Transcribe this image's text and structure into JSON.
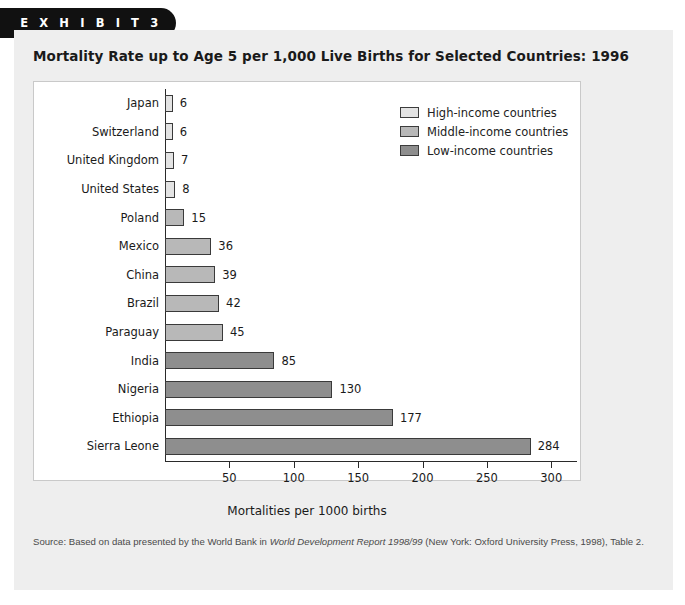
{
  "exhibit": {
    "badge_label": "E X H I B I T   3"
  },
  "title": "Mortality Rate up to Age 5 per 1,000 Live Births for Selected Countries: 1996",
  "legend": {
    "items": [
      {
        "label": "High-income countries",
        "color": "#e3e3e3"
      },
      {
        "label": "Middle-income countries",
        "color": "#b8b8b8"
      },
      {
        "label": "Low-income countries",
        "color": "#8e8e8e"
      }
    ]
  },
  "source": {
    "prefix": "Source: Based on data presented by the World Bank in ",
    "italic": "World Development Report 1998/99",
    "suffix": " (New York: Oxford University Press, 1998), Table 2."
  },
  "chart_data": {
    "type": "bar",
    "orientation": "horizontal",
    "title": "Mortality Rate up to Age 5 per 1,000 Live Births for Selected Countries: 1996",
    "xlabel": "Mortalities per 1000 births",
    "ylabel": "",
    "xlim": [
      0,
      320
    ],
    "xticks": [
      50,
      100,
      150,
      200,
      250,
      300
    ],
    "grid": false,
    "legend_position": "top-right",
    "categories": [
      "Japan",
      "Switzerland",
      "United Kingdom",
      "United States",
      "Poland",
      "Mexico",
      "China",
      "Brazil",
      "Paraguay",
      "India",
      "Nigeria",
      "Ethiopia",
      "Sierra Leone"
    ],
    "values": [
      6,
      6,
      7,
      8,
      15,
      36,
      39,
      42,
      45,
      85,
      130,
      177,
      284
    ],
    "groups": [
      "High-income countries",
      "High-income countries",
      "High-income countries",
      "High-income countries",
      "Middle-income countries",
      "Middle-income countries",
      "Middle-income countries",
      "Middle-income countries",
      "Middle-income countries",
      "Low-income countries",
      "Low-income countries",
      "Low-income countries",
      "Low-income countries"
    ],
    "bars": [
      {
        "category": "Japan",
        "value": 6,
        "group": "High-income countries",
        "color": "#e3e3e3"
      },
      {
        "category": "Switzerland",
        "value": 6,
        "group": "High-income countries",
        "color": "#e3e3e3"
      },
      {
        "category": "United Kingdom",
        "value": 7,
        "group": "High-income countries",
        "color": "#e3e3e3"
      },
      {
        "category": "United States",
        "value": 8,
        "group": "High-income countries",
        "color": "#e3e3e3"
      },
      {
        "category": "Poland",
        "value": 15,
        "group": "Middle-income countries",
        "color": "#b8b8b8"
      },
      {
        "category": "Mexico",
        "value": 36,
        "group": "Middle-income countries",
        "color": "#b8b8b8"
      },
      {
        "category": "China",
        "value": 39,
        "group": "Middle-income countries",
        "color": "#b8b8b8"
      },
      {
        "category": "Brazil",
        "value": 42,
        "group": "Middle-income countries",
        "color": "#b8b8b8"
      },
      {
        "category": "Paraguay",
        "value": 45,
        "group": "Middle-income countries",
        "color": "#b8b8b8"
      },
      {
        "category": "India",
        "value": 85,
        "group": "Low-income countries",
        "color": "#8e8e8e"
      },
      {
        "category": "Nigeria",
        "value": 130,
        "group": "Low-income countries",
        "color": "#8e8e8e"
      },
      {
        "category": "Ethiopia",
        "value": 177,
        "group": "Low-income countries",
        "color": "#8e8e8e"
      },
      {
        "category": "Sierra Leone",
        "value": 284,
        "group": "Low-income countries",
        "color": "#8e8e8e"
      }
    ]
  }
}
